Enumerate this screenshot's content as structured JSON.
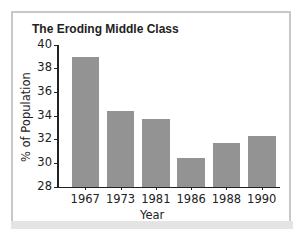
{
  "chart_data": {
    "type": "bar",
    "title": "The Eroding Middle Class",
    "xlabel": "Year",
    "ylabel": "% of Population",
    "categories": [
      "1967",
      "1973",
      "1981",
      "1986",
      "1988",
      "1990"
    ],
    "values": [
      39.0,
      34.4,
      33.7,
      30.4,
      31.7,
      32.3
    ],
    "ylim": [
      28,
      40
    ],
    "yticks": [
      28,
      30,
      32,
      34,
      36,
      38,
      40
    ],
    "grid": false,
    "legend": null,
    "bar_color": "#939393"
  }
}
